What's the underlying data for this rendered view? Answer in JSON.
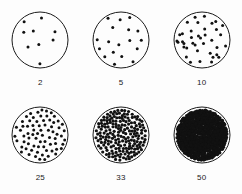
{
  "figure": {
    "background_color": "#fdfdfd",
    "ink_color": "#111111",
    "outline_color": "#1a1a1a"
  },
  "chart_data": {
    "type": "scatter",
    "title": "",
    "subtitle": "",
    "xlabel": "",
    "ylabel": "",
    "grid": false,
    "legend_position": "none",
    "layout": {
      "rows": 2,
      "columns": 3,
      "panel_shape": "circle",
      "panel_diameter_px": 58
    },
    "categories": [
      "2",
      "5",
      "10",
      "25",
      "33",
      "50"
    ],
    "values": [
      2,
      5,
      10,
      25,
      33,
      50
    ],
    "series": [
      {
        "name": "dot density",
        "values": [
          2,
          5,
          10,
          25,
          33,
          50
        ]
      },
      {
        "name": "approximate dot count",
        "values": [
          9,
          18,
          38,
          72,
          190,
          520
        ]
      }
    ],
    "panels": [
      {
        "label": "2",
        "value": 2,
        "dot_count": 9,
        "dot_radius_px": 1.5,
        "row": 0,
        "column": 0,
        "seed": 17
      },
      {
        "label": "5",
        "value": 5,
        "dot_count": 18,
        "dot_radius_px": 1.5,
        "row": 0,
        "column": 1,
        "seed": 41
      },
      {
        "label": "10",
        "value": 10,
        "dot_count": 38,
        "dot_radius_px": 1.5,
        "row": 0,
        "column": 2,
        "seed": 73
      },
      {
        "label": "25",
        "value": 25,
        "dot_count": 72,
        "dot_radius_px": 1.5,
        "row": 1,
        "column": 0,
        "seed": 109
      },
      {
        "label": "33",
        "value": 33,
        "dot_count": 190,
        "dot_radius_px": 1.6,
        "row": 1,
        "column": 1,
        "seed": 151
      },
      {
        "label": "50",
        "value": 50,
        "dot_count": 520,
        "dot_radius_px": 1.8,
        "row": 1,
        "column": 2,
        "seed": 199
      }
    ]
  }
}
